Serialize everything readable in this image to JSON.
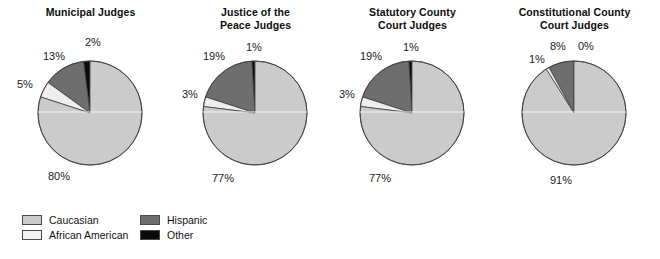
{
  "chart_data": [
    {
      "type": "pie",
      "title": "Municipal Judges",
      "categories": [
        "Caucasian",
        "African American",
        "Hispanic",
        "Other"
      ],
      "values": [
        80,
        5,
        13,
        2
      ],
      "labels": [
        "80%",
        "5%",
        "13%",
        "2%"
      ],
      "colors": [
        "#cbcbcb",
        "#eeeeee",
        "#6e6e6e",
        "#0a0a0a"
      ],
      "legend": "bottom-left",
      "grid": false
    },
    {
      "type": "pie",
      "title": "Justice of the\nPeace Judges",
      "categories": [
        "Caucasian",
        "African American",
        "Hispanic",
        "Other"
      ],
      "values": [
        77,
        3,
        19,
        1
      ],
      "labels": [
        "77%",
        "3%",
        "19%",
        "1%"
      ],
      "colors": [
        "#cbcbcb",
        "#eeeeee",
        "#6e6e6e",
        "#0a0a0a"
      ],
      "legend": "bottom-left",
      "grid": false
    },
    {
      "type": "pie",
      "title": "Statutory County\nCourt Judges",
      "categories": [
        "Caucasian",
        "African American",
        "Hispanic",
        "Other"
      ],
      "values": [
        77,
        3,
        19,
        1
      ],
      "labels": [
        "77%",
        "3%",
        "19%",
        "1%"
      ],
      "colors": [
        "#cbcbcb",
        "#eeeeee",
        "#6e6e6e",
        "#0a0a0a"
      ],
      "legend": "bottom-left",
      "grid": false
    },
    {
      "type": "pie",
      "title": "Constitutional County\nCourt Judges",
      "categories": [
        "Caucasian",
        "African American",
        "Hispanic",
        "Other"
      ],
      "values": [
        91,
        1,
        8,
        0
      ],
      "labels": [
        "91%",
        "1%",
        "8%",
        "0%"
      ],
      "colors": [
        "#cbcbcb",
        "#eeeeee",
        "#6e6e6e",
        "#0a0a0a"
      ],
      "legend": "bottom-left",
      "grid": false
    }
  ],
  "charts": [
    {
      "title": "Municipal Judges",
      "slices": [
        {
          "name": "Other",
          "value": 2,
          "label": "2%",
          "color": "#0a0a0a",
          "lx": 77,
          "ly": 36
        },
        {
          "name": "Hispanic",
          "value": 13,
          "label": "13%",
          "color": "#6e6e6e",
          "lx": 35,
          "ly": 50
        },
        {
          "name": "African American",
          "value": 5,
          "label": "5%",
          "color": "#eeeeee",
          "lx": 9,
          "ly": 78
        },
        {
          "name": "Caucasian",
          "value": 80,
          "label": "80%",
          "color": "#cbcbcb",
          "lx": 40,
          "ly": 170
        }
      ]
    },
    {
      "title": "Justice of the\nPeace Judges",
      "slices": [
        {
          "name": "Other",
          "value": 1,
          "label": "1%",
          "color": "#0a0a0a",
          "lx": 73,
          "ly": 41
        },
        {
          "name": "Hispanic",
          "value": 19,
          "label": "19%",
          "color": "#6e6e6e",
          "lx": 30,
          "ly": 50
        },
        {
          "name": "African American",
          "value": 3,
          "label": "3%",
          "color": "#eeeeee",
          "lx": 9,
          "ly": 88
        },
        {
          "name": "Caucasian",
          "value": 77,
          "label": "77%",
          "color": "#cbcbcb",
          "lx": 39,
          "ly": 172
        }
      ]
    },
    {
      "title": "Statutory County\nCourt Judges",
      "slices": [
        {
          "name": "Other",
          "value": 1,
          "label": "1%",
          "color": "#0a0a0a",
          "lx": 73,
          "ly": 41
        },
        {
          "name": "Hispanic",
          "value": 19,
          "label": "19%",
          "color": "#6e6e6e",
          "lx": 30,
          "ly": 50
        },
        {
          "name": "African American",
          "value": 3,
          "label": "3%",
          "color": "#eeeeee",
          "lx": 9,
          "ly": 88
        },
        {
          "name": "Caucasian",
          "value": 77,
          "label": "77%",
          "color": "#cbcbcb",
          "lx": 39,
          "ly": 172
        }
      ]
    },
    {
      "title": "Constitutional County\nCourt Judges",
      "slices": [
        {
          "name": "Other",
          "value": 0,
          "label": "0%",
          "color": "#0a0a0a",
          "lx": 86,
          "ly": 40
        },
        {
          "name": "Hispanic",
          "value": 8,
          "label": "8%",
          "color": "#6e6e6e",
          "lx": 58,
          "ly": 40
        },
        {
          "name": "African American",
          "value": 1,
          "label": "1%",
          "color": "#eeeeee",
          "lx": 37,
          "ly": 53
        },
        {
          "name": "Caucasian",
          "value": 91,
          "label": "91%",
          "color": "#cbcbcb",
          "lx": 58,
          "ly": 174
        }
      ]
    }
  ],
  "legend": {
    "items": [
      {
        "label": "Caucasian",
        "color": "#cbcbcb"
      },
      {
        "label": "African American",
        "color": "#f2f2f2"
      },
      {
        "label": "Hispanic",
        "color": "#6e6e6e"
      },
      {
        "label": "Other",
        "color": "#0a0a0a"
      }
    ]
  }
}
